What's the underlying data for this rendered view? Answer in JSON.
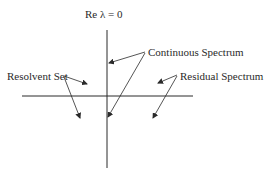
{
  "diagram": {
    "axis_label": "Re λ = 0",
    "labels": {
      "continuous": "Continuous Spectrum",
      "resolvent": "Resolvent Set",
      "residual": "Residual Spectrum"
    },
    "colors": {
      "line": "#2a2a2a",
      "background": "#ffffff"
    }
  }
}
